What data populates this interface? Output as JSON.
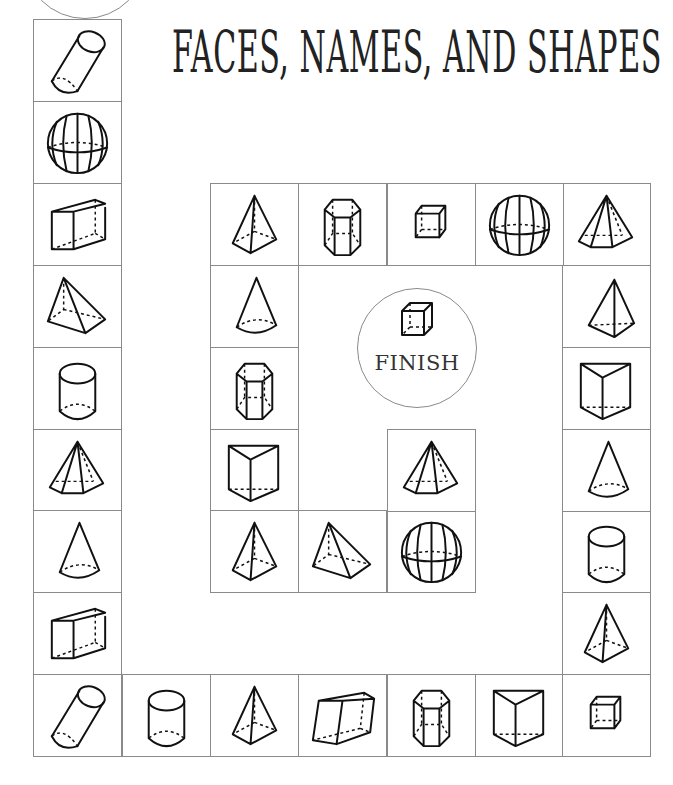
{
  "title": "FACES, NAMES, AND SHAPES",
  "finish": {
    "label": "FINISH",
    "icon": "cube"
  },
  "start": {
    "label": ""
  },
  "colors": {
    "grid_line": "#8a8a8a",
    "ink": "#111111",
    "background": "#ffffff"
  },
  "board": {
    "path": [
      {
        "id": 1,
        "shape": "oblique-cylinder",
        "x": 33,
        "y": 19
      },
      {
        "id": 2,
        "shape": "sphere",
        "x": 33,
        "y": 101
      },
      {
        "id": 3,
        "shape": "rectangular-prism",
        "x": 33,
        "y": 183
      },
      {
        "id": 4,
        "shape": "triangular-pyramid",
        "x": 33,
        "y": 265
      },
      {
        "id": 5,
        "shape": "cylinder",
        "x": 33,
        "y": 347
      },
      {
        "id": 6,
        "shape": "hexagonal-pyramid",
        "x": 33,
        "y": 429
      },
      {
        "id": 7,
        "shape": "cone",
        "x": 33,
        "y": 510
      },
      {
        "id": 8,
        "shape": "rectangular-prism",
        "x": 33,
        "y": 592
      },
      {
        "id": 9,
        "shape": "oblique-cylinder",
        "x": 33,
        "y": 674
      },
      {
        "id": 10,
        "shape": "cylinder",
        "x": 122,
        "y": 674
      },
      {
        "id": 11,
        "shape": "square-pyramid",
        "x": 210,
        "y": 674
      },
      {
        "id": 12,
        "shape": "oblique-prism",
        "x": 298,
        "y": 674
      },
      {
        "id": 13,
        "shape": "hexagonal-prism",
        "x": 387,
        "y": 674
      },
      {
        "id": 14,
        "shape": "triangular-prism",
        "x": 475,
        "y": 674
      },
      {
        "id": 15,
        "shape": "cube",
        "x": 562,
        "y": 674
      },
      {
        "id": 16,
        "shape": "square-pyramid",
        "x": 562,
        "y": 592
      },
      {
        "id": 17,
        "shape": "cylinder",
        "x": 562,
        "y": 510
      },
      {
        "id": 18,
        "shape": "cone",
        "x": 562,
        "y": 429
      },
      {
        "id": 19,
        "shape": "triangular-prism",
        "x": 562,
        "y": 347
      },
      {
        "id": 20,
        "shape": "triangular-pyramid-upright",
        "x": 562,
        "y": 265
      },
      {
        "id": 21,
        "shape": "hexagonal-pyramid",
        "x": 562,
        "y": 183
      },
      {
        "id": 22,
        "shape": "sphere",
        "x": 475,
        "y": 183
      },
      {
        "id": 23,
        "shape": "cube",
        "x": 387,
        "y": 183
      },
      {
        "id": 24,
        "shape": "hexagonal-prism",
        "x": 298,
        "y": 183
      },
      {
        "id": 25,
        "shape": "square-pyramid",
        "x": 210,
        "y": 183
      },
      {
        "id": 26,
        "shape": "cone",
        "x": 210,
        "y": 265
      },
      {
        "id": 27,
        "shape": "hexagonal-prism",
        "x": 210,
        "y": 347
      },
      {
        "id": 28,
        "shape": "triangular-prism",
        "x": 210,
        "y": 429
      },
      {
        "id": 29,
        "shape": "square-pyramid",
        "x": 210,
        "y": 510
      },
      {
        "id": 30,
        "shape": "triangular-pyramid",
        "x": 298,
        "y": 510
      },
      {
        "id": 31,
        "shape": "sphere",
        "x": 387,
        "y": 510
      },
      {
        "id": 32,
        "shape": "hexagonal-pyramid",
        "x": 387,
        "y": 429
      }
    ]
  }
}
